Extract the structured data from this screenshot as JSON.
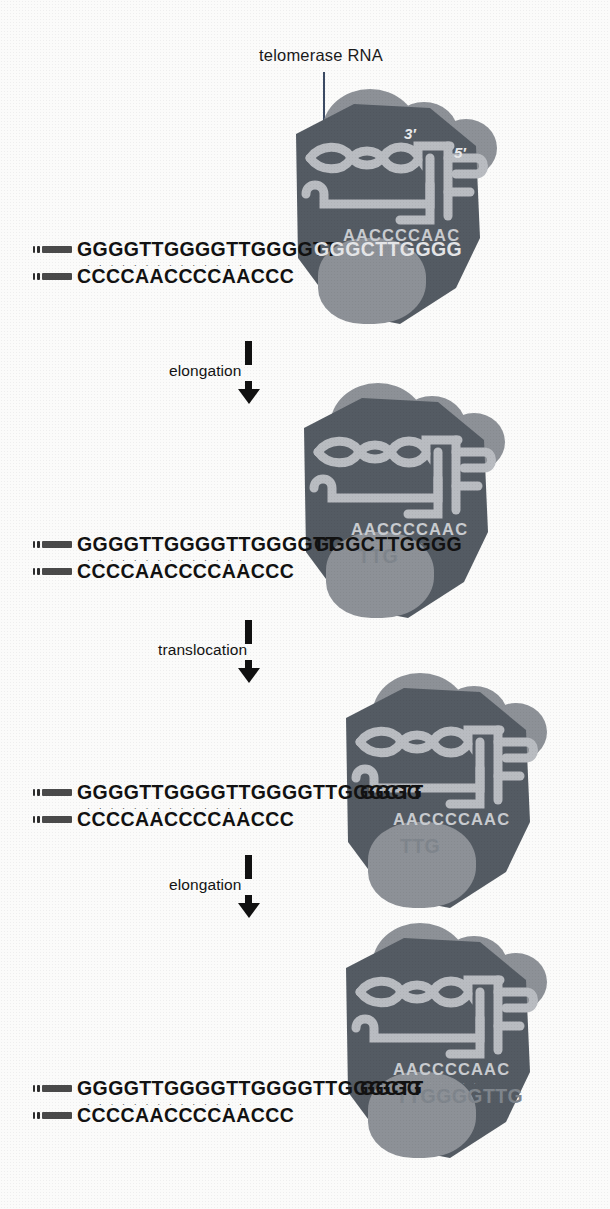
{
  "figure": {
    "title_callout": "telomerase RNA",
    "rna_labels": {
      "three_prime": "3′",
      "five_prime": "5′"
    },
    "rna_template_sequence": "AACCCCAAC",
    "colors": {
      "enzyme_body": "#545b63",
      "enzyme_lobe": "#8d9197",
      "enzyme_lobe_dark": "#6f757c",
      "rna_ribbon": "#b9bcc1",
      "dna_text": "#121212",
      "dna_text_faded": "#8e9298",
      "arrow": "#111111",
      "background": "#fbfbfa"
    }
  },
  "steps": [
    {
      "id": "step-elongation-1",
      "label": "elongation"
    },
    {
      "id": "step-translocation",
      "label": "translocation"
    },
    {
      "id": "step-elongation-2",
      "label": "elongation"
    }
  ],
  "panels": [
    {
      "id": "panel-1",
      "caption": "telomerase bound to telomere end",
      "top_strand_visible": "GGGGTTGGGGTTGGGGTT",
      "top_strand_under_enzyme": "GGGCTTGGGG",
      "top_strand_hidden": "",
      "bottom_strand": "CCCCAACCCCAACCC",
      "template_sequence": "AACCCCAAC",
      "show_callout": true,
      "show_primes": true
    },
    {
      "id": "panel-2",
      "caption": "after elongation",
      "top_strand_visible": "GGGGTTGGGGTTGGGGTT",
      "top_strand_under_enzyme": "GGGCTTGGGG",
      "top_strand_hidden": "TTG",
      "bottom_strand": "CCCCAACCCCAACCC",
      "template_sequence": "AACCCCAAC",
      "show_callout": false,
      "show_primes": false
    },
    {
      "id": "panel-3",
      "caption": "after translocation",
      "top_strand_visible": "GGGGTTGGGGTTGGGGTTGGGCTT",
      "top_strand_under_enzyme": "GGGG",
      "top_strand_hidden": "TTG",
      "bottom_strand": "CCCCAACCCCAACCC",
      "template_sequence": "AACCCCAAC",
      "show_callout": false,
      "show_primes": false
    },
    {
      "id": "panel-4",
      "caption": "after second elongation",
      "top_strand_visible": "GGGGTTGGGGTTGGGGTTGGGCTT",
      "top_strand_under_enzyme": "GGGG",
      "top_strand_hidden": "TTGGGGTTG",
      "bottom_strand": "CCCCAACCCCAACCC",
      "template_sequence": "AACCCCAAC",
      "show_callout": false,
      "show_primes": false
    }
  ]
}
